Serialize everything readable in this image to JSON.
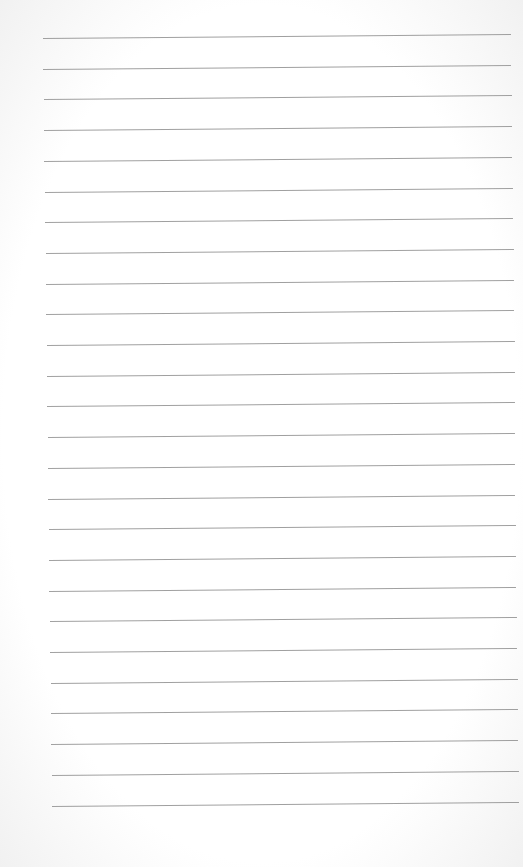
{
  "page": {
    "type": "lined-paper",
    "background_color": "#ffffff",
    "line_color": "#8f8f8f",
    "line_count": 26,
    "first_line_y": 38,
    "line_spacing": 30.7,
    "left_start_top": 43,
    "left_start_bottom": 52,
    "right_end_top": 511,
    "right_end_bottom": 519,
    "tilt_px": -4
  }
}
